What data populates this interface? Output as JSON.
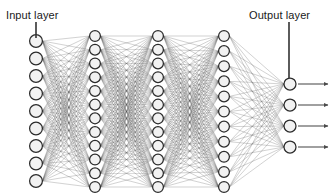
{
  "diagram": {
    "type": "neural-network",
    "width": 334,
    "height": 196,
    "background_color": "#ffffff",
    "node_fill": "#f2f2f2",
    "node_stroke": "#2b2b2b",
    "edge_color": "#555555",
    "pointer_color": "#333333",
    "arrow_color": "#4a4a4a",
    "labels": {
      "input": "Input layer",
      "output": "Output layer"
    },
    "pointers": [
      {
        "name": "input-pointer",
        "x": 36,
        "y1": 22,
        "y2": 38
      },
      {
        "name": "output-pointer",
        "x": 289,
        "y1": 22,
        "y2": 78
      }
    ],
    "layers": [
      {
        "name": "input-layer",
        "role": "input",
        "count": 9,
        "cx": 36,
        "top": 41,
        "bottom": 181,
        "r": 6.4
      },
      {
        "name": "hidden-layer-1",
        "role": "hidden",
        "count": 12,
        "cx": 95,
        "top": 36,
        "bottom": 187,
        "r": 5.4
      },
      {
        "name": "hidden-layer-2",
        "role": "hidden",
        "count": 12,
        "cx": 158,
        "top": 36,
        "bottom": 187,
        "r": 5.4
      },
      {
        "name": "hidden-layer-3",
        "role": "hidden",
        "count": 11,
        "cx": 224,
        "top": 36,
        "bottom": 187,
        "r": 5.4
      },
      {
        "name": "output-layer",
        "role": "output",
        "count": 4,
        "top": 84,
        "bottom": 147,
        "cx": 290,
        "r": 6.0
      }
    ],
    "output_arrows": {
      "name": "output-arrow",
      "count": 4,
      "x_start": 298,
      "x_end": 328
    }
  }
}
